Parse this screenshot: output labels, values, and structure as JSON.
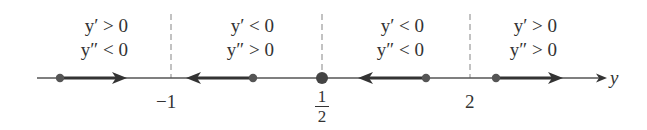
{
  "diagram": {
    "type": "phase_line",
    "axis_label": "y",
    "critical_points": [
      {
        "label": "−1",
        "value": -1
      },
      {
        "label_num": "1",
        "label_den": "2",
        "value": 0.5
      },
      {
        "label": "2",
        "value": 2
      }
    ],
    "regions": [
      {
        "y1": "y′ > 0",
        "y2": "y″ < 0",
        "arrow": "right"
      },
      {
        "y1": "y′ < 0",
        "y2": "y″ > 0",
        "arrow": "left"
      },
      {
        "y1": "y′ < 0",
        "y2": "y″ < 0",
        "arrow": "left"
      },
      {
        "y1": "y′ > 0",
        "y2": "y″ > 0",
        "arrow": "right"
      }
    ],
    "colors": {
      "line": "#444444",
      "arrow": "#333333",
      "dashed": "#9a9a9a",
      "text": "#333333"
    }
  }
}
